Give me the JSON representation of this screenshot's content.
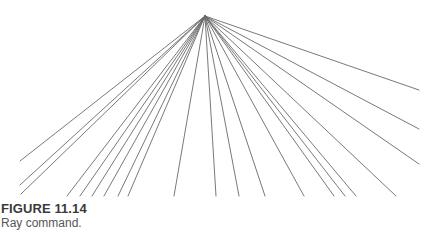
{
  "figure": {
    "label": "FIGURE 11.14",
    "caption": "Ray command."
  },
  "diagram": {
    "type": "ray-fan",
    "origin": [
      205,
      16
    ],
    "ray_color": "#6a6a6a",
    "ray_endpoints": [
      [
        20,
        161
      ],
      [
        20,
        185
      ],
      [
        21,
        194
      ],
      [
        67,
        196
      ],
      [
        80,
        196
      ],
      [
        92,
        196
      ],
      [
        104,
        196
      ],
      [
        118,
        196
      ],
      [
        128,
        196
      ],
      [
        174,
        196
      ],
      [
        216,
        196
      ],
      [
        239,
        196
      ],
      [
        265,
        196
      ],
      [
        304,
        196
      ],
      [
        334,
        196
      ],
      [
        345,
        196
      ],
      [
        356,
        196
      ],
      [
        396,
        196
      ],
      [
        419,
        164
      ],
      [
        419,
        129
      ],
      [
        419,
        90
      ]
    ]
  }
}
